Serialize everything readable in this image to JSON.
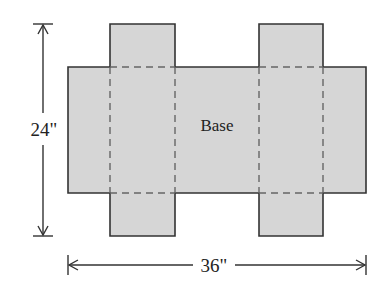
{
  "diagram": {
    "type": "box-net",
    "colors": {
      "fill": "#d6d6d6",
      "outline": "#333333",
      "fold_line": "#666666",
      "dimension_line": "#333333",
      "text": "#222222"
    },
    "labels": {
      "base": "Base",
      "height_dimension": "24\"",
      "width_dimension": "36\""
    },
    "dimensions": {
      "overall_height": "24\"",
      "overall_width": "36\""
    },
    "regions": [
      {
        "name": "base",
        "label": "Base"
      },
      {
        "name": "top-left-flap"
      },
      {
        "name": "top-right-flap"
      },
      {
        "name": "bottom-left-flap"
      },
      {
        "name": "bottom-right-flap"
      }
    ]
  }
}
